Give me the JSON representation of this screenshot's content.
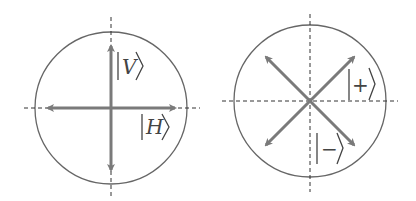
{
  "diagrams": [
    {
      "name": "rectilinear-basis",
      "labels": {
        "vertical": "V",
        "horizontal": "H"
      }
    },
    {
      "name": "diagonal-basis",
      "labels": {
        "plus": "+",
        "minus": "−"
      }
    }
  ],
  "colors": {
    "circle": "#666666",
    "arrow": "#7a7a7a",
    "axis": "#333333",
    "text": "#444444"
  }
}
